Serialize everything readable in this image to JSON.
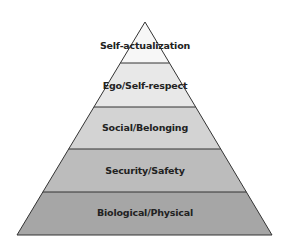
{
  "diagram": {
    "type": "pyramid",
    "title": "",
    "levels": [
      {
        "label": "Self-actualization",
        "fill": "#f7f7f7"
      },
      {
        "label": "Ego/Self-respect",
        "fill": "#e8e8e8"
      },
      {
        "label": "Social/Belonging",
        "fill": "#d3d3d3"
      },
      {
        "label": "Security/Safety",
        "fill": "#bcbcbc"
      },
      {
        "label": "Biological/Physical",
        "fill": "#a6a6a6"
      }
    ],
    "outline_color": "#333333"
  }
}
